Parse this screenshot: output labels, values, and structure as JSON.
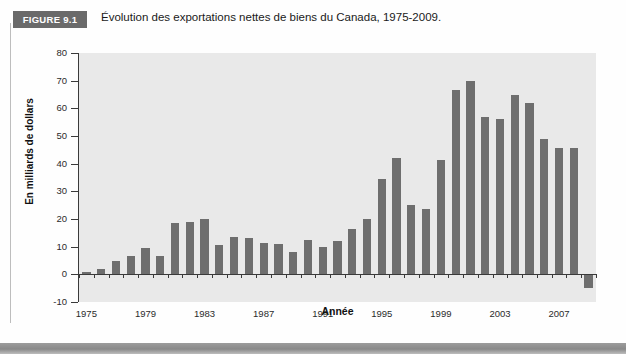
{
  "figure": {
    "badge_label": "FIGURE 9.1",
    "title": "Évolution des exportations nettes de biens du Canada, 1975-2009."
  },
  "chart_data": {
    "type": "bar",
    "title": "Évolution des exportations nettes de biens du Canada, 1975-2009.",
    "xlabel": "Année",
    "ylabel": "En milliards de dollars",
    "ylim": [
      -10,
      80
    ],
    "ytick_values": [
      -10,
      0,
      10,
      20,
      30,
      40,
      50,
      60,
      70,
      80
    ],
    "ytick_labels": [
      "-10",
      "0",
      "10",
      "20",
      "30",
      "40",
      "50",
      "60",
      "70",
      "80"
    ],
    "xtick_labels": [
      "1975",
      "1979",
      "1983",
      "1987",
      "1991",
      "1995",
      "1999",
      "2003",
      "2007"
    ],
    "xtick_values": [
      1975,
      1979,
      1983,
      1987,
      1991,
      1995,
      1999,
      2003,
      2007
    ],
    "grid": false,
    "legend": "none",
    "bar_color": "#6e6e6e",
    "plot_background": "#e9e9e9",
    "categories": [
      1975,
      1976,
      1977,
      1978,
      1979,
      1980,
      1981,
      1982,
      1983,
      1984,
      1985,
      1986,
      1987,
      1988,
      1989,
      1990,
      1991,
      1992,
      1993,
      1994,
      1995,
      1996,
      1997,
      1998,
      1999,
      2000,
      2001,
      2002,
      2003,
      2004,
      2005,
      2006,
      2007,
      2008,
      2009
    ],
    "values": [
      1,
      2,
      5,
      6.5,
      9.5,
      6.5,
      18.5,
      19,
      20,
      10.5,
      13.5,
      13,
      11.5,
      11,
      8,
      12.5,
      10,
      12,
      16.5,
      20,
      34.5,
      42,
      25,
      23.5,
      41.5,
      66.5,
      70,
      57,
      56,
      65,
      62,
      49,
      45.5,
      45.5,
      -5
    ]
  },
  "colors": {
    "badge_background": "#6a6a6a",
    "badge_text": "#ffffff",
    "axis": "#3a3a3a",
    "bar": "#6e6e6e",
    "panel": "#e9e9e9",
    "footer": "#8a8a8a"
  }
}
